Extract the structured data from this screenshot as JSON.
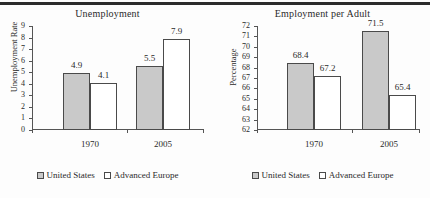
{
  "page": {
    "top_rule_color": "#2b2b2b",
    "background": "#fdfdfd"
  },
  "colors": {
    "united_states_fill": "#c9c9c9",
    "advanced_europe_fill": "#ffffff",
    "bar_outline": "#4a4a4a",
    "axis": "#555555",
    "text": "#2a2a2a"
  },
  "legend": {
    "united_states": "United States",
    "advanced_europe": "Advanced Europe"
  },
  "chart_data": [
    {
      "type": "bar",
      "id": "unemployment",
      "title": "Unemployment",
      "xlabel": "",
      "ylabel": "Unemployment Rate",
      "categories": [
        "1970",
        "2005"
      ],
      "ylim": [
        0,
        9
      ],
      "yticks": [
        "0",
        "1",
        "2",
        "3",
        "4",
        "5",
        "6",
        "7",
        "8",
        "9"
      ],
      "grid": false,
      "legend_position": "bottom",
      "series": [
        {
          "name": "United States",
          "values": [
            4.9,
            5.5
          ],
          "labels": [
            "4.9",
            "5.5"
          ],
          "fill": "#c9c9c9"
        },
        {
          "name": "Advanced Europe",
          "values": [
            4.1,
            7.9
          ],
          "labels": [
            "4.1",
            "7.9"
          ],
          "fill": "#ffffff"
        }
      ]
    },
    {
      "type": "bar",
      "id": "employment-per-adult",
      "title": "Employment per Adult",
      "xlabel": "",
      "ylabel": "Percentage",
      "categories": [
        "1970",
        "2005"
      ],
      "ylim": [
        62,
        72
      ],
      "yticks": [
        "62",
        "63",
        "64",
        "65",
        "66",
        "67",
        "68",
        "69",
        "70",
        "71",
        "72"
      ],
      "grid": false,
      "legend_position": "bottom",
      "series": [
        {
          "name": "United States",
          "values": [
            68.4,
            71.5
          ],
          "labels": [
            "68.4",
            "71.5"
          ],
          "fill": "#c9c9c9"
        },
        {
          "name": "Advanced Europe",
          "values": [
            67.2,
            65.4
          ],
          "labels": [
            "67.2",
            "65.4"
          ],
          "fill": "#ffffff"
        }
      ]
    }
  ]
}
